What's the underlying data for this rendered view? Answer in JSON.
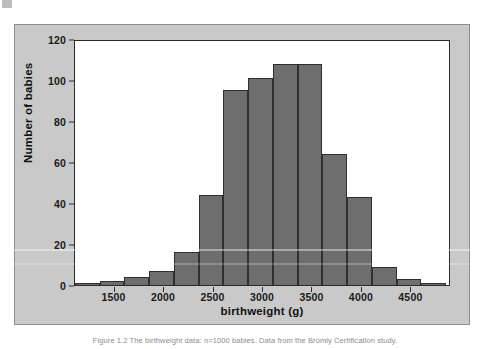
{
  "figure": {
    "caption": "Figure 1.2   The birthweight data: n=1000 babies. Data from the Bromly Certification study.",
    "colors": {
      "bar_fill": "#6e6e6e",
      "bar_edge": "#2f2f2f",
      "panel_background": "#c9c9c9",
      "plot_background": "#ffffff",
      "axis": "#2b2b2b",
      "text": "#111111"
    }
  },
  "chart_data": {
    "type": "bar",
    "title": "",
    "subtitle": "",
    "xlabel": "birthweight (g)",
    "ylabel": "Number of babies",
    "xlim": [
      1100,
      4900
    ],
    "ylim": [
      0,
      120
    ],
    "grid": false,
    "legend": null,
    "bin_width": 250,
    "xticks": [
      1500,
      2000,
      2500,
      3000,
      3500,
      4000,
      4500
    ],
    "xtick_labels": [
      "1500",
      "2000",
      "2500",
      "3000",
      "3500",
      "4000",
      "4500"
    ],
    "yticks": [
      0,
      20,
      40,
      60,
      80,
      100,
      120
    ],
    "ytick_labels": [
      "0",
      "20",
      "40",
      "60",
      "80",
      "100",
      "120"
    ],
    "categories": [
      "1100-1350",
      "1350-1600",
      "1600-1850",
      "1850-2100",
      "2100-2350",
      "2350-2600",
      "2600-2850",
      "2850-3100",
      "3100-3350",
      "3350-3600",
      "3600-3850",
      "3850-4100",
      "4100-4350",
      "4350-4600",
      "4600-4900"
    ],
    "bins": [
      {
        "start": 1100,
        "end": 1350,
        "value": 1
      },
      {
        "start": 1350,
        "end": 1600,
        "value": 2
      },
      {
        "start": 1600,
        "end": 1850,
        "value": 4
      },
      {
        "start": 1850,
        "end": 2100,
        "value": 7
      },
      {
        "start": 2100,
        "end": 2350,
        "value": 16
      },
      {
        "start": 2350,
        "end": 2600,
        "value": 44
      },
      {
        "start": 2600,
        "end": 2850,
        "value": 95
      },
      {
        "start": 2850,
        "end": 3100,
        "value": 101
      },
      {
        "start": 3100,
        "end": 3350,
        "value": 108
      },
      {
        "start": 3350,
        "end": 3600,
        "value": 108
      },
      {
        "start": 3600,
        "end": 3850,
        "value": 64
      },
      {
        "start": 3850,
        "end": 4100,
        "value": 43
      },
      {
        "start": 4100,
        "end": 4350,
        "value": 9
      },
      {
        "start": 4350,
        "end": 4600,
        "value": 3
      },
      {
        "start": 4600,
        "end": 4850,
        "value": 1
      }
    ],
    "values": [
      1,
      2,
      4,
      7,
      16,
      44,
      95,
      101,
      108,
      108,
      64,
      43,
      9,
      3,
      1
    ]
  }
}
